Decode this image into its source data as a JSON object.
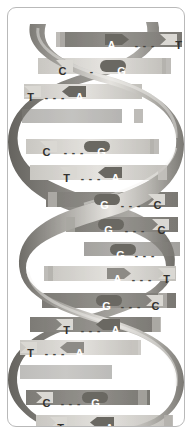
{
  "figure": {
    "frame": {
      "border_color": "#b9b9b9",
      "background_color": "#ffffff",
      "corner_radius": "9px"
    },
    "palette": {
      "ribbon_dark": "#6f6d68",
      "ribbon_mid": "#9a9893",
      "ribbon_light": "#d7d5d0",
      "ribbon_highlight": "#efeeea",
      "rung_dark": "#8a8883",
      "rung_light": "#d2d0cb",
      "base_dark_fill": "#6a6862",
      "base_light_fill": "#dad8d3",
      "text_on_dark": "#ffffff",
      "text_on_light": "#33312f",
      "bond_dash": "#46443f"
    }
  },
  "base_pairs": [
    {
      "id": "bp-1",
      "left_base": "A",
      "right_base": "T",
      "bond": "- - -",
      "left_tone": "dark",
      "right_tone": "light",
      "bond_tone": "onlight",
      "x": 97,
      "y": 30,
      "width": 80
    },
    {
      "id": "bp-2",
      "left_base": "C",
      "right_base": "G",
      "bond": "-",
      "left_tone": "light",
      "right_tone": "dark",
      "bond_tone": "onlight",
      "x": 48,
      "y": 56,
      "width": 72
    },
    {
      "id": "bp-3",
      "left_base": "T",
      "right_base": "A",
      "bond": "- - -",
      "left_tone": "light",
      "right_tone": "dark",
      "bond_tone": "onlight",
      "x": 16,
      "y": 82,
      "width": 62
    },
    {
      "id": "bp-4",
      "left_base": "C",
      "right_base": "G",
      "bond": "- - -",
      "left_tone": "light",
      "right_tone": "dark",
      "bond_tone": "onlight",
      "x": 32,
      "y": 137,
      "width": 68
    },
    {
      "id": "bp-5",
      "left_base": "T",
      "right_base": "A",
      "bond": "- - -",
      "left_tone": "light",
      "right_tone": "dark",
      "bond_tone": "onlight",
      "x": 52,
      "y": 163,
      "width": 62
    },
    {
      "id": "bp-6",
      "left_base": "G",
      "right_base": "C",
      "bond": "- - -",
      "left_tone": "dark",
      "right_tone": "light",
      "bond_tone": "onlight",
      "x": 90,
      "y": 190,
      "width": 66
    },
    {
      "id": "bp-7",
      "left_base": "G",
      "right_base": "C",
      "bond": "- - -",
      "left_tone": "dark",
      "right_tone": "light",
      "bond_tone": "onlight",
      "x": 94,
      "y": 215,
      "width": 66
    },
    {
      "id": "bp-8",
      "left_base": "G",
      "right_base": "",
      "bond": "- - -",
      "left_tone": "dark",
      "right_tone": "light",
      "bond_tone": "onlight",
      "x": 106,
      "y": 240,
      "width": 62
    },
    {
      "id": "bp-9",
      "left_base": "A",
      "right_base": "T",
      "bond": "- - -",
      "left_tone": "dark",
      "right_tone": "light",
      "bond_tone": "onlight",
      "x": 103,
      "y": 264,
      "width": 62
    },
    {
      "id": "bp-10",
      "left_base": "G",
      "right_base": "C",
      "bond": "- - -",
      "left_tone": "dark",
      "right_tone": "light",
      "bond_tone": "onlight",
      "x": 92,
      "y": 291,
      "width": 62
    },
    {
      "id": "bp-11",
      "left_base": "T",
      "right_base": "A",
      "bond": "- - -",
      "left_tone": "light",
      "right_tone": "dark",
      "bond_tone": "onlight",
      "x": 52,
      "y": 315,
      "width": 62
    },
    {
      "id": "bp-12",
      "left_base": "T",
      "right_base": "A",
      "bond": "- - -",
      "left_tone": "light",
      "right_tone": "dark",
      "bond_tone": "onlight",
      "x": 16,
      "y": 338,
      "width": 62
    },
    {
      "id": "bp-13",
      "left_base": "C",
      "right_base": "G",
      "bond": "- - -",
      "left_tone": "light",
      "right_tone": "dark",
      "bond_tone": "onlight",
      "x": 32,
      "y": 388,
      "width": 62
    },
    {
      "id": "bp-14",
      "left_base": "T",
      "right_base": "A",
      "bond": "- - -",
      "left_tone": "light",
      "right_tone": "dark",
      "bond_tone": "onlight",
      "x": 46,
      "y": 413,
      "width": 62
    }
  ]
}
